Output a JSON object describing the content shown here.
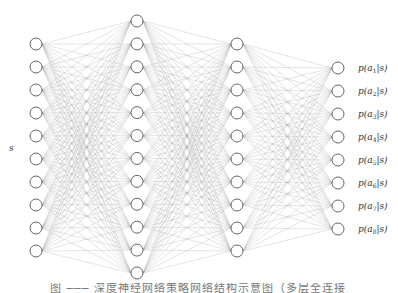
{
  "figure": {
    "input_label": "s",
    "caption": "图 ─── 深度神经网络策略网络结构示意图（多层全连接）",
    "colors": {
      "background": "#ffffff",
      "edge": "#9a9a9a",
      "node_stroke": "#555555",
      "node_fill": "#ffffff",
      "text": "#333333"
    },
    "layers": [
      {
        "name": "input-layer",
        "x": 36,
        "count": 10,
        "y_start": 44,
        "y_end": 251
      },
      {
        "name": "hidden-layer-1",
        "x": 137,
        "count": 12,
        "y_start": 21,
        "y_end": 273
      },
      {
        "name": "hidden-layer-2",
        "x": 237,
        "count": 10,
        "y_start": 44,
        "y_end": 251
      },
      {
        "name": "output-layer",
        "x": 338,
        "count": 8,
        "y_start": 68,
        "y_end": 229
      }
    ],
    "node_radius": 6,
    "output_labels": [
      {
        "prefix": "p(a",
        "sub": "1",
        "suffix": "|s)"
      },
      {
        "prefix": "p(a",
        "sub": "2",
        "suffix": "|s)"
      },
      {
        "prefix": "p(a",
        "sub": "3",
        "suffix": "|s)"
      },
      {
        "prefix": "p(a",
        "sub": "4",
        "suffix": "|s)"
      },
      {
        "prefix": "p(a",
        "sub": "5",
        "suffix": "|s)"
      },
      {
        "prefix": "p(a",
        "sub": "6",
        "suffix": "|s)"
      },
      {
        "prefix": "p(a",
        "sub": "7",
        "suffix": "|s)"
      },
      {
        "prefix": "p(a",
        "sub": "8",
        "suffix": "|s)"
      }
    ],
    "output_label_x": 358,
    "input_label_pos": {
      "x": 9,
      "y": 151
    }
  }
}
